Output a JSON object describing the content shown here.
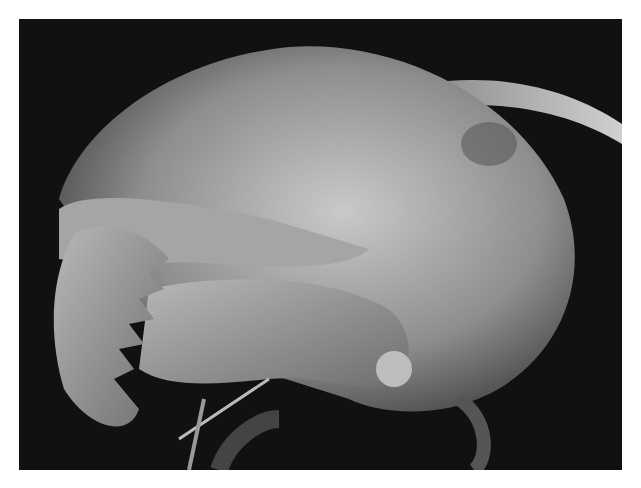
{
  "image": {
    "subject": "Scanning electron micrograph of an ant head with toothed mandibles and antenna",
    "alt": "SEM image of ant head",
    "style": "grayscale",
    "colors": {
      "background": "#ffffff",
      "frame": "#111111",
      "head_light": "#c8c8c8",
      "head_mid": "#8a8a8a",
      "head_dark": "#3a3a3a"
    }
  }
}
